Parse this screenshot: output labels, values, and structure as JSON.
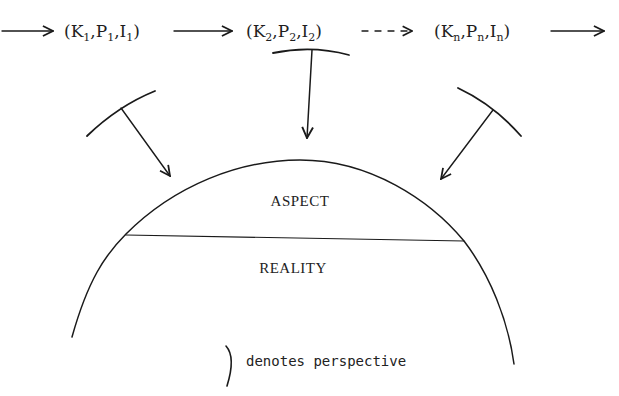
{
  "sequence": {
    "states": [
      {
        "K": "K",
        "K_sub": "1",
        "P": "P",
        "P_sub": "1",
        "I": "I",
        "I_sub": "1"
      },
      {
        "K": "K",
        "K_sub": "2",
        "P": "P",
        "P_sub": "2",
        "I": "I",
        "I_sub": "2"
      },
      {
        "K": "K",
        "K_sub": "n",
        "P": "P",
        "P_sub": "n",
        "I": "I",
        "I_sub": "n"
      }
    ],
    "arrows": [
      "solid-in",
      "solid",
      "dashed",
      "solid-out"
    ]
  },
  "regions": {
    "upper_label": "ASPECT",
    "lower_label": "REALITY"
  },
  "perspectives": [
    {
      "position": "left"
    },
    {
      "position": "center"
    },
    {
      "position": "right"
    }
  ],
  "legend": {
    "symbol": ")",
    "text": "denotes perspective"
  },
  "colors": {
    "ink": "#1a1a1a",
    "background": "#ffffff"
  }
}
